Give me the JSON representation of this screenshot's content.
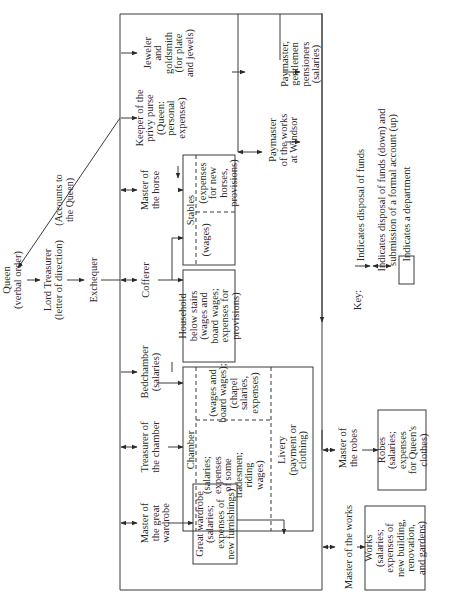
{
  "diagram": {
    "orientation": "rotated 90 degrees counter-clockwise",
    "top_chain": {
      "queen": [
        "Queen",
        "(verbal order)"
      ],
      "lord_treasurer": [
        "Lord Treasurer",
        "(letter of direction)"
      ],
      "exchequer": [
        "Exchequer"
      ],
      "accounts_label": [
        "(Accounts to",
        "the Queen)"
      ]
    },
    "officers": {
      "jeweler": [
        "Jeweler",
        "and",
        "goldsmith",
        "(for plate",
        "and jewels)"
      ],
      "privy_purse": [
        "Keeper of the",
        "privy purse",
        "(Queen:",
        "personal",
        "expenses)"
      ],
      "master_horse": [
        "Master of",
        "the horse"
      ],
      "cofferer": [
        "Cofferer"
      ],
      "bedchamber": [
        "Bedchamber",
        "(salaries)"
      ],
      "treasurer_chamber": [
        "Treasurer of",
        "the chamber"
      ],
      "master_wardrobe": [
        "Master of",
        "the great",
        "wardrobe"
      ]
    },
    "departments": {
      "stables": {
        "title": "Stables",
        "left": [
          "(wages)"
        ],
        "right": [
          "(expenses",
          "for new",
          "horses,",
          "provisions)"
        ]
      },
      "household": [
        "Household",
        "below stairs",
        "(wages and",
        "board wages;",
        "expenses for",
        "provisions)"
      ],
      "chamber": {
        "title": "Chamber",
        "left": [
          "(salaries;",
          "expenses",
          "of some",
          "tradesmen;",
          "riding",
          "wages)"
        ],
        "right": [
          "(wages and",
          "board wages);",
          "(chapel",
          "salaries,",
          "expenses)"
        ]
      },
      "livery": [
        "Livery",
        "(payment or",
        "clothing)"
      ],
      "great_wardrobe": [
        "Great wardrobe",
        "(salaries;",
        "expenses of",
        "new furnishings)"
      ],
      "robes": [
        "Robes",
        "(salaries;",
        "expenses",
        "for Queen's",
        "clothes)"
      ],
      "works": [
        "Works",
        "(salaries;",
        "expenses of",
        "new building,",
        "renovation,",
        "and gardens)"
      ]
    },
    "outside": {
      "paymaster_pensioners": [
        "Paymaster,",
        "gentlemen",
        "pensioners",
        "(salaries)"
      ],
      "paymaster_windsor": [
        "Paymaster",
        "of the works",
        "at Windsor"
      ],
      "master_robes": [
        "Master of",
        "the robes"
      ],
      "master_works": [
        "Master of the works"
      ]
    },
    "key": {
      "title": "Key:",
      "items": [
        [
          "Indicates disposal of funds"
        ],
        [
          "Indicates disposal of funds (down) and",
          "submission of a formal account (up)"
        ],
        [
          "Indicates a department"
        ]
      ]
    },
    "colors": {
      "line": "#3a3a3a",
      "text": "#2a2a2a",
      "background": "#ffffff"
    }
  }
}
